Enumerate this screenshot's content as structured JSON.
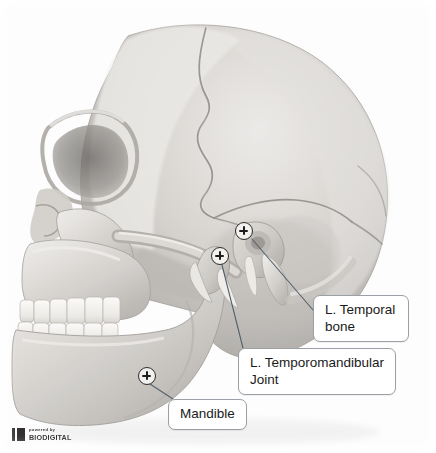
{
  "viewer": {
    "name": "anatomy-3d-viewer",
    "width": 436,
    "height": 453,
    "background_color": "#fdfdfd",
    "model_description": "Grayscale 3D rendering of a human skull in left lateral view, showing cranium, zygomatic arch, maxilla with teeth, and mandible"
  },
  "annotations": [
    {
      "id": "l-temporal-bone",
      "label": "L. Temporal\nbone",
      "pin": {
        "x": 244,
        "y": 231
      },
      "box": {
        "x": 313,
        "y": 295,
        "width": 96,
        "height": 45
      },
      "leader": {
        "x1": 252,
        "y1": 239,
        "x2": 313,
        "y2": 310
      }
    },
    {
      "id": "l-temporomandibular-joint",
      "label": "L. Temporomandibular\nJoint",
      "pin": {
        "x": 220,
        "y": 256
      },
      "box": {
        "x": 238,
        "y": 348,
        "width": 158,
        "height": 45
      },
      "leader": {
        "x1": 222,
        "y1": 265,
        "x2": 243,
        "y2": 348
      }
    },
    {
      "id": "mandible",
      "label": "Mandible",
      "pin": {
        "x": 147,
        "y": 376
      },
      "box": {
        "x": 168,
        "y": 399,
        "width": 79,
        "height": 27
      },
      "leader": {
        "x1": 150,
        "y1": 384,
        "x2": 173,
        "y2": 399
      }
    }
  ],
  "callout_style": {
    "border_color": "#9aa0a6",
    "fill_color": "#ffffff",
    "text_color": "#1a1a1a",
    "leader_color": "#55606b"
  },
  "watermark": {
    "powered_by": "powered by",
    "brand": "BIODIGITAL",
    "mark_color": "#231f20"
  }
}
